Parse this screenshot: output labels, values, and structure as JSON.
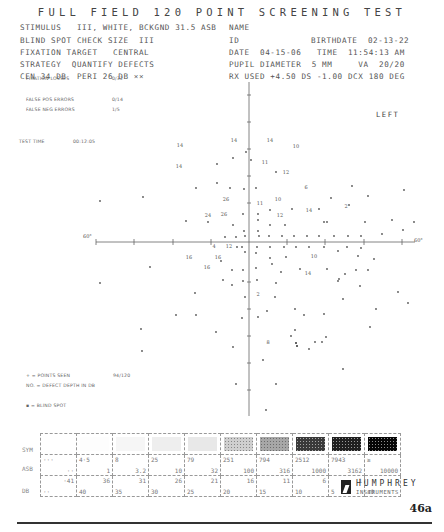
{
  "title": "FULL FIELD 120 POINT SCREENING TEST",
  "header_left": [
    "STIMULUS   III, WHITE, BCKGND 31.5 ASB",
    "BLIND SPOT CHECK SIZE  III",
    "FIXATION TARGET   CENTRAL",
    "STRATEGY  QUANTIFY DEFECTS",
    "CEN 34 DB  PERI 26 DB ××"
  ],
  "header_right": {
    "name_label": "NAME",
    "id_label": "ID",
    "birthdate": "BIRTHDATE  02-13-22",
    "date_time": "DATE  04-15-06   TIME  11:54:13 AM",
    "pupil_va": "PUPIL DIAMETER  5 MM     VA  20/20",
    "rx": "RX USED +4.50 DS -1.00 DCX 180 DEG"
  },
  "eye": "LEFT",
  "reliability": {
    "fixation_losses_label": "FIXATION LOSSES",
    "fixation_losses": "0/32",
    "false_pos_label": "FALSE POS ERRORS",
    "false_pos": "0/14",
    "false_neg_label": "FALSE NEG ERRORS",
    "false_neg": "1/5",
    "test_time_label": "TEST TIME",
    "test_time": "00:12:05"
  },
  "legend": {
    "points_seen_label": "+ = POINTS SEEN",
    "points_seen": "94/120",
    "defect_depth": "NO. = DEFECT DEPTH IN DB",
    "blind_spot": "▪ = BLIND SPOT"
  },
  "axis_labels": {
    "left": "60°",
    "right": "60°"
  },
  "plot": {
    "center": [
      249,
      242
    ],
    "defects": [
      {
        "x": 180,
        "y": 147,
        "v": "14"
      },
      {
        "x": 234,
        "y": 142,
        "v": "14"
      },
      {
        "x": 270,
        "y": 142,
        "v": "14"
      },
      {
        "x": 296,
        "y": 148,
        "v": "10"
      },
      {
        "x": 179,
        "y": 168,
        "v": "14"
      },
      {
        "x": 265,
        "y": 164,
        "v": "11"
      },
      {
        "x": 286,
        "y": 174,
        "v": "12"
      },
      {
        "x": 306,
        "y": 189,
        "v": "6"
      },
      {
        "x": 226,
        "y": 201,
        "v": "26"
      },
      {
        "x": 260,
        "y": 205,
        "v": "11"
      },
      {
        "x": 278,
        "y": 201,
        "v": "10"
      },
      {
        "x": 208,
        "y": 217,
        "v": "24"
      },
      {
        "x": 224,
        "y": 216,
        "v": "26"
      },
      {
        "x": 280,
        "y": 217,
        "v": "12"
      },
      {
        "x": 309,
        "y": 212,
        "v": "14"
      },
      {
        "x": 346,
        "y": 208,
        "v": "2"
      },
      {
        "x": 214,
        "y": 248,
        "v": "4"
      },
      {
        "x": 229,
        "y": 248,
        "v": "12"
      },
      {
        "x": 189,
        "y": 259,
        "v": "16"
      },
      {
        "x": 218,
        "y": 259,
        "v": "16"
      },
      {
        "x": 207,
        "y": 269,
        "v": "16"
      },
      {
        "x": 314,
        "y": 258,
        "v": "10"
      },
      {
        "x": 308,
        "y": 275,
        "v": "14"
      },
      {
        "x": 258,
        "y": 296,
        "v": "2"
      },
      {
        "x": 268,
        "y": 344,
        "v": "8"
      }
    ],
    "seen": [
      [
        217,
        164
      ],
      [
        233,
        158
      ],
      [
        251,
        160
      ],
      [
        246,
        152
      ],
      [
        196,
        188
      ],
      [
        143,
        197
      ],
      [
        217,
        183
      ],
      [
        230,
        188
      ],
      [
        244,
        189
      ],
      [
        256,
        188
      ],
      [
        276,
        172
      ],
      [
        352,
        186
      ],
      [
        368,
        196
      ],
      [
        404,
        190
      ],
      [
        100,
        201
      ],
      [
        270,
        210
      ],
      [
        243,
        214
      ],
      [
        258,
        214
      ],
      [
        258,
        220
      ],
      [
        292,
        209
      ],
      [
        319,
        209
      ],
      [
        331,
        198
      ],
      [
        324,
        222
      ],
      [
        349,
        205
      ],
      [
        186,
        221
      ],
      [
        208,
        222
      ],
      [
        233,
        225
      ],
      [
        270,
        225
      ],
      [
        285,
        225
      ],
      [
        327,
        222
      ],
      [
        365,
        222
      ],
      [
        392,
        220
      ],
      [
        403,
        230
      ],
      [
        414,
        222
      ],
      [
        244,
        231
      ],
      [
        258,
        231
      ],
      [
        225,
        237
      ],
      [
        236,
        237
      ],
      [
        245,
        236
      ],
      [
        259,
        236
      ],
      [
        269,
        236
      ],
      [
        282,
        236
      ],
      [
        294,
        236
      ],
      [
        307,
        236
      ],
      [
        319,
        236
      ],
      [
        334,
        236
      ],
      [
        348,
        236
      ],
      [
        361,
        236
      ],
      [
        382,
        234
      ],
      [
        237,
        247
      ],
      [
        242,
        247
      ],
      [
        257,
        247
      ],
      [
        270,
        247
      ],
      [
        284,
        247
      ],
      [
        296,
        247
      ],
      [
        309,
        247
      ],
      [
        324,
        247
      ],
      [
        347,
        247
      ],
      [
        361,
        248
      ],
      [
        245,
        252
      ],
      [
        256,
        253
      ],
      [
        270,
        258
      ],
      [
        286,
        257
      ],
      [
        338,
        251
      ],
      [
        358,
        256
      ],
      [
        374,
        259
      ],
      [
        221,
        261
      ],
      [
        232,
        270
      ],
      [
        243,
        270
      ],
      [
        256,
        268
      ],
      [
        272,
        264
      ],
      [
        281,
        272
      ],
      [
        300,
        269
      ],
      [
        327,
        269
      ],
      [
        345,
        274
      ],
      [
        356,
        270
      ],
      [
        368,
        270
      ],
      [
        223,
        280
      ],
      [
        243,
        281
      ],
      [
        257,
        280
      ],
      [
        276,
        283
      ],
      [
        338,
        281
      ],
      [
        360,
        286
      ],
      [
        150,
        267
      ],
      [
        100,
        283
      ],
      [
        195,
        293
      ],
      [
        176,
        315
      ],
      [
        232,
        285
      ],
      [
        275,
        297
      ],
      [
        267,
        311
      ],
      [
        295,
        309
      ],
      [
        343,
        299
      ],
      [
        376,
        309
      ],
      [
        398,
        292
      ],
      [
        408,
        303
      ],
      [
        196,
        315
      ],
      [
        242,
        318
      ],
      [
        258,
        317
      ],
      [
        304,
        315
      ],
      [
        324,
        314
      ],
      [
        245,
        297
      ],
      [
        326,
        337
      ],
      [
        339,
        279
      ],
      [
        141,
        329
      ],
      [
        216,
        332
      ],
      [
        233,
        347
      ],
      [
        263,
        360
      ],
      [
        291,
        336
      ],
      [
        315,
        342
      ],
      [
        322,
        342
      ],
      [
        295,
        330
      ],
      [
        309,
        349
      ],
      [
        370,
        327
      ],
      [
        142,
        351
      ],
      [
        343,
        369
      ],
      [
        236,
        384
      ],
      [
        276,
        384
      ],
      [
        266,
        410
      ]
    ],
    "blind_spots": [
      [
        296,
        343
      ],
      [
        297,
        346
      ]
    ]
  },
  "grayscale": {
    "row_labels": [
      "SYM",
      "ASB",
      "DB"
    ],
    "columns": [
      {
        "asb_top": "···",
        "asb_bot": "··",
        "db_top": "·41",
        "db_bot": "··"
      },
      {
        "asb_top": "4·5",
        "asb_bot": "1",
        "db_top": "36",
        "db_bot": "40"
      },
      {
        "asb_top": "8",
        "asb_bot": "3.2",
        "db_top": "31",
        "db_bot": "35"
      },
      {
        "asb_top": "25",
        "asb_bot": "10",
        "db_top": "26",
        "db_bot": "30"
      },
      {
        "asb_top": "79",
        "asb_bot": "32",
        "db_top": "21",
        "db_bot": "25"
      },
      {
        "asb_top": "251",
        "asb_bot": "100",
        "db_top": "16",
        "db_bot": "20"
      },
      {
        "asb_top": "794",
        "asb_bot": "316",
        "db_top": "11",
        "db_bot": "15"
      },
      {
        "asb_top": "2512",
        "asb_bot": "1000",
        "db_top": "6",
        "db_bot": "10"
      },
      {
        "asb_top": "7943",
        "asb_bot": "3162",
        "db_top": "1",
        "db_bot": "5"
      },
      {
        "asb_top": "≥",
        "asb_bot": "10000",
        "db_top": "",
        "db_bot": "≤0"
      }
    ],
    "swatches": [
      "#ffffff",
      "#fdfdfd",
      "#f6f6f6",
      "#eeeeee",
      "#e8e8e8",
      "#cfcfcf",
      "#a7a7a7",
      "#3a3a3a",
      "#202020",
      "#050505"
    ]
  },
  "brand": {
    "name": "HUMPHREY",
    "sub": "INSTRUMENTS"
  },
  "page_number": "46a"
}
